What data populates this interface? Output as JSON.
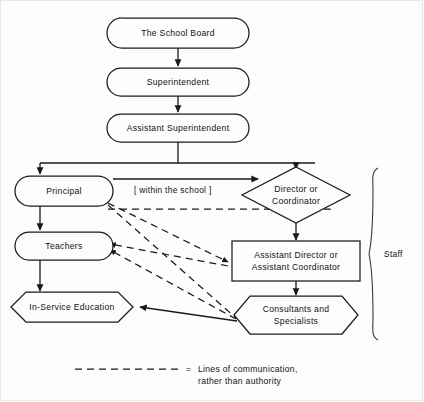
{
  "diagram": {
    "colors": {
      "line": "#1a1a1a",
      "background": "#fdfdfc",
      "text": "#111111"
    },
    "nodes": [
      {
        "id": "school-board",
        "label": "The School Board",
        "shape": "stadium",
        "cx": 178,
        "cy": 33,
        "w": 142,
        "h": 30
      },
      {
        "id": "superintendent",
        "label": "Superintendent",
        "shape": "stadium",
        "cx": 178,
        "cy": 82,
        "w": 142,
        "h": 28
      },
      {
        "id": "assistant-super",
        "label": "Assistant Superintendent",
        "shape": "stadium",
        "cx": 178,
        "cy": 128,
        "w": 142,
        "h": 28
      },
      {
        "id": "principal",
        "label": "Principal",
        "shape": "stadium",
        "cx": 64,
        "cy": 191,
        "w": 98,
        "h": 30
      },
      {
        "id": "teachers",
        "label": "Teachers",
        "shape": "stadium",
        "cx": 64,
        "cy": 246,
        "w": 98,
        "h": 28
      },
      {
        "id": "in-service",
        "label": "In-Service Education",
        "shape": "hexagon",
        "cx": 72,
        "cy": 307,
        "w": 122,
        "h": 30
      },
      {
        "id": "director",
        "label_line1": "Director or",
        "label_line2": "Coordinator",
        "shape": "diamond",
        "cx": 296,
        "cy": 195,
        "w": 100,
        "h": 56
      },
      {
        "id": "assistant-director",
        "label_line1": "Assistant Director or",
        "label_line2": "Assistant Coordinator",
        "shape": "rect",
        "cx": 296,
        "cy": 261,
        "w": 128,
        "h": 40
      },
      {
        "id": "consultants",
        "label_line1": "Consultants and",
        "label_line2": "Specialists",
        "shape": "hexagon",
        "cx": 296,
        "cy": 315,
        "w": 124,
        "h": 38
      }
    ],
    "annotations": {
      "within_school": "[ within the school ]",
      "staff_bracket": "Staff"
    },
    "legend": {
      "equals": "=",
      "line1": "Lines of communication,",
      "line2": "rather than authority"
    }
  }
}
